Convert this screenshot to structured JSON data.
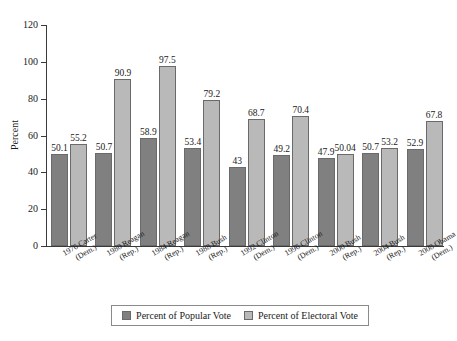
{
  "chart_data": {
    "type": "bar",
    "title": "",
    "xlabel": "",
    "ylabel": "Percent",
    "ylim": [
      0,
      120
    ],
    "yticks": [
      0,
      20,
      40,
      60,
      80,
      100,
      120
    ],
    "grid": false,
    "legend_position": "bottom",
    "categories": [
      "1976 Carter (Dem.)",
      "1980 Reagan (Rep.)",
      "1984 Reagan (Rep.)",
      "1988 Bush (Rep.)",
      "1992 Clinton (Dem.)",
      "1996 Clinton (Dem.)",
      "2000 Bush (Rep.)",
      "2004 Bush (Rep.)",
      "2008 Obama (Dem.)"
    ],
    "category_lines": [
      {
        "line1": "1976 Carter",
        "line2": "(Dem.)"
      },
      {
        "line1": "1980 Reagan",
        "line2": "(Rep.)"
      },
      {
        "line1": "1984 Reagan",
        "line2": "(Rep.)"
      },
      {
        "line1": "1988 Bush",
        "line2": "(Rep.)"
      },
      {
        "line1": "1992 Clinton",
        "line2": "(Dem.)"
      },
      {
        "line1": "1996 Clinton",
        "line2": "(Dem.)"
      },
      {
        "line1": "2000 Bush",
        "line2": "(Rep.)"
      },
      {
        "line1": "2004 Bush",
        "line2": "(Rep.)"
      },
      {
        "line1": "2008 Obama",
        "line2": "(Dem.)"
      }
    ],
    "series": [
      {
        "name": "Percent of Popular Vote",
        "color": "#808080",
        "values": [
          50.1,
          50.7,
          58.9,
          53.4,
          43,
          49.2,
          47.9,
          50.7,
          52.9
        ],
        "labels": [
          "50.1",
          "50.7",
          "58.9",
          "53.4",
          "43",
          "49.2",
          "47.9",
          "50.7",
          "52.9"
        ]
      },
      {
        "name": "Percent of Electoral Vote",
        "color": "#b9b9b9",
        "values": [
          55.2,
          90.9,
          97.5,
          79.2,
          68.7,
          70.4,
          50.04,
          53.2,
          67.8
        ],
        "labels": [
          "55.2",
          "90.9",
          "97.5",
          "79.2",
          "68.7",
          "70.4",
          "50.04",
          "53.2",
          "67.8"
        ]
      }
    ]
  }
}
